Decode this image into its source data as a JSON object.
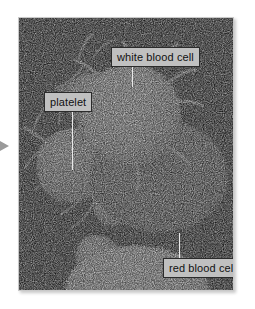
{
  "figure": {
    "type": "scanning-electron-micrograph",
    "background_color": "#ffffff",
    "photo_background_color": "#050505",
    "frame_border_color": "#c9c9c9"
  },
  "pointer": {
    "name": "left-pointer-arrow",
    "direction": "right",
    "color": "#9a9a9a"
  },
  "labels": [
    {
      "id": "white-blood-cell",
      "text": "white blood cell",
      "box_color": "#c0c0c0",
      "text_color": "#111111",
      "border_color": "#2b2b2b",
      "leader_line_color": "#e8e8e8"
    },
    {
      "id": "platelet",
      "text": "platelet",
      "box_color": "#c0c0c0",
      "text_color": "#111111",
      "border_color": "#2b2b2b",
      "leader_line_color": "#e8e8e8"
    },
    {
      "id": "red-blood-cell",
      "text": "red blood cell",
      "box_color": "#c0c0c0",
      "text_color": "#111111",
      "border_color": "#2b2b2b",
      "leader_line_color": "#e8e8e8"
    }
  ],
  "cells": [
    {
      "id": "white-blood-cell",
      "appearance": "bright rough spherical leukocyte with ruffled microvilli"
    },
    {
      "id": "red-blood-cell",
      "appearance": "gray biconcave disc erythrocyte"
    },
    {
      "id": "platelet-upper",
      "appearance": "irregular thrombocyte with long spiky pseudopodia"
    },
    {
      "id": "platelet-middle",
      "appearance": "small thrombocyte with pseudopodia"
    },
    {
      "id": "platelet-lower",
      "appearance": "small rounded thrombocyte"
    },
    {
      "id": "cell-bottom-edge",
      "appearance": "bright cell cropped at bottom edge"
    }
  ]
}
